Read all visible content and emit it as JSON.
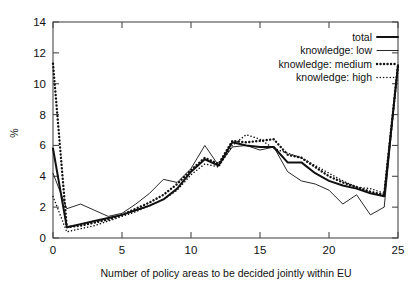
{
  "chart_data": {
    "type": "line",
    "title": "",
    "xlabel": "Number of policy areas to be decided jointly within EU",
    "ylabel": "%",
    "xlim": [
      0,
      25
    ],
    "ylim": [
      0,
      14
    ],
    "xticks": [
      0,
      5,
      10,
      15,
      20,
      25
    ],
    "yticks": [
      0,
      2,
      4,
      6,
      8,
      10,
      12,
      14
    ],
    "grid": false,
    "legend_position": "top-right",
    "x": [
      0,
      1,
      2,
      3,
      4,
      5,
      6,
      7,
      8,
      9,
      10,
      11,
      12,
      13,
      14,
      15,
      16,
      17,
      18,
      19,
      20,
      21,
      22,
      23,
      24,
      25
    ],
    "series": [
      {
        "name": "total",
        "style": "solid-thick",
        "values": [
          5.8,
          0.7,
          0.9,
          1.1,
          1.3,
          1.5,
          1.8,
          2.1,
          2.5,
          3.2,
          4.3,
          5.1,
          4.7,
          6.2,
          6.0,
          5.9,
          5.9,
          4.9,
          4.9,
          4.2,
          3.7,
          3.4,
          3.2,
          2.9,
          2.7,
          11.2
        ]
      },
      {
        "name": "knowledge: low",
        "style": "solid-thin",
        "values": [
          4.2,
          1.9,
          2.2,
          1.8,
          1.4,
          1.6,
          2.2,
          2.9,
          3.8,
          3.6,
          4.5,
          6.0,
          4.7,
          5.9,
          6.0,
          5.7,
          5.9,
          4.3,
          3.7,
          3.5,
          3.1,
          2.2,
          2.8,
          1.5,
          2.0,
          11.2
        ]
      },
      {
        "name": "knowledge: medium",
        "style": "dotted-bold",
        "values": [
          11.3,
          0.7,
          0.8,
          1.0,
          1.2,
          1.5,
          1.9,
          2.3,
          2.8,
          3.5,
          4.4,
          5.2,
          4.8,
          6.3,
          6.2,
          6.3,
          6.4,
          5.4,
          5.2,
          4.6,
          4.0,
          3.6,
          3.3,
          3.0,
          2.8,
          11.2
        ]
      },
      {
        "name": "knowledge: high",
        "style": "dotted-fine",
        "values": [
          2.7,
          0.4,
          0.6,
          0.8,
          1.1,
          1.4,
          1.7,
          2.1,
          2.5,
          3.1,
          4.1,
          4.8,
          4.6,
          6.0,
          6.7,
          6.4,
          5.8,
          5.5,
          5.2,
          4.7,
          4.2,
          3.7,
          3.3,
          3.2,
          2.9,
          11.2
        ]
      }
    ],
    "legend": [
      {
        "label": "total"
      },
      {
        "label": "knowledge: low"
      },
      {
        "label": "knowledge: medium"
      },
      {
        "label": "knowledge: high"
      }
    ]
  }
}
